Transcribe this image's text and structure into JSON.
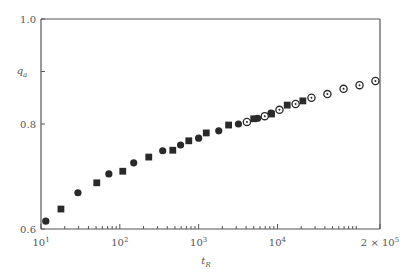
{
  "chart_data": {
    "type": "scatter",
    "title": "",
    "xlabel": "t",
    "xlabel_sub": "R",
    "ylabel": "q",
    "ylabel_sub": "a",
    "xscale": "log",
    "xlim": [
      10,
      200000
    ],
    "ylim": [
      0.6,
      1.0
    ],
    "grid": false,
    "legend": "none",
    "x_ticks": [
      {
        "value": 10,
        "base": "10",
        "exp": "1"
      },
      {
        "value": 100,
        "base": "10",
        "exp": "2"
      },
      {
        "value": 1000,
        "base": "10",
        "exp": "3"
      },
      {
        "value": 10000,
        "base": "10",
        "exp": "4"
      },
      {
        "value": 200000,
        "base": "2 × 10",
        "exp": "5"
      }
    ],
    "x_minor_ticks": [
      20,
      30,
      40,
      50,
      60,
      70,
      80,
      90,
      200,
      300,
      400,
      500,
      600,
      700,
      800,
      900,
      2000,
      3000,
      4000,
      5000,
      6000,
      7000,
      8000,
      9000,
      20000,
      30000,
      40000,
      50000,
      60000,
      70000,
      80000,
      90000,
      100000
    ],
    "y_ticks": [
      {
        "value": 0.6,
        "label": "0.6"
      },
      {
        "value": 0.8,
        "label": "0.8"
      },
      {
        "value": 1.0,
        "label": "1.0"
      }
    ],
    "y_label_tick": 0.9,
    "series": [
      {
        "name": "filled circles",
        "marker": "filled-circle",
        "x": [
          11.5,
          29.4,
          72.6,
          150,
          350,
          590,
          1000,
          1800,
          3200,
          5600,
          8300
        ],
        "y": [
          0.615,
          0.669,
          0.705,
          0.726,
          0.749,
          0.76,
          0.773,
          0.787,
          0.8,
          0.811,
          0.821
        ]
      },
      {
        "name": "filled squares",
        "marker": "filled-square",
        "x": [
          17.9,
          51,
          109,
          233,
          470,
          750,
          1250,
          2400,
          5000,
          8400,
          13300,
          21000
        ],
        "y": [
          0.638,
          0.688,
          0.71,
          0.737,
          0.75,
          0.768,
          0.783,
          0.798,
          0.81,
          0.819,
          0.836,
          0.844
        ]
      },
      {
        "name": "open circles",
        "marker": "open-circle",
        "x": [
          4100,
          6900,
          10600,
          17000,
          27000,
          43000,
          69000,
          110000,
          175000
        ],
        "y": [
          0.804,
          0.815,
          0.827,
          0.838,
          0.85,
          0.857,
          0.867,
          0.874,
          0.882
        ]
      }
    ]
  }
}
